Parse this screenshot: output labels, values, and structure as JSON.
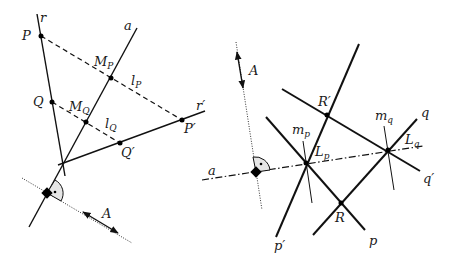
{
  "figure_left": {
    "labels": {
      "r": "r",
      "a": "a",
      "P": "P",
      "Q": "Q",
      "M_P": "M",
      "M_P_sub": "P",
      "M_Q": "M",
      "M_Q_sub": "Q",
      "l_P": "l",
      "l_P_sub": "P",
      "l_Q": "l",
      "l_Q_sub": "Q",
      "r_prime": "r′",
      "P_prime": "P′",
      "Q_prime": "Q′",
      "A": "A"
    }
  },
  "figure_right": {
    "labels": {
      "A": "A",
      "a": "a",
      "R_prime": "R′",
      "R": "R",
      "m_p": "m",
      "m_p_sub": "p",
      "m_q": "m",
      "m_q_sub": "q",
      "L_p": "L",
      "L_p_sub": "p",
      "L_q": "L",
      "L_q_sub": "q",
      "q": "q",
      "q_prime": "q′",
      "p": "p",
      "p_prime": "p′"
    }
  },
  "colors": {
    "stroke": "#111111",
    "angle_fill": "#e6e6e6",
    "background": "#ffffff"
  }
}
